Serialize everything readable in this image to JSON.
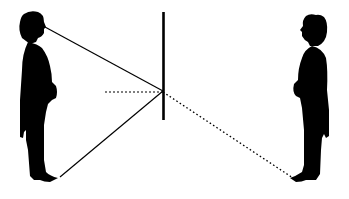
{
  "diagram": {
    "type": "plane-mirror-reflection",
    "colors": {
      "background": "#ffffff",
      "ink": "#000000"
    },
    "elements": {
      "observer": {
        "label": "",
        "position": "left",
        "facing": "right"
      },
      "mirror": {
        "label": "",
        "x": 163,
        "y_top": 12,
        "y_bottom": 120
      },
      "image": {
        "label": "",
        "position": "right",
        "facing": "left"
      },
      "rays": [
        {
          "name": "eye-ray",
          "from": [
            45,
            27
          ],
          "to": [
            163,
            91
          ],
          "style": "solid"
        },
        {
          "name": "foot-ray",
          "from": [
            60,
            177
          ],
          "to": [
            163,
            91
          ],
          "style": "solid"
        },
        {
          "name": "normal-line",
          "from": [
            105,
            92
          ],
          "to": [
            163,
            92
          ],
          "style": "dotted"
        },
        {
          "name": "virtual-ray",
          "from": [
            163,
            92
          ],
          "to": [
            293,
            178
          ],
          "style": "dotted"
        }
      ]
    }
  }
}
